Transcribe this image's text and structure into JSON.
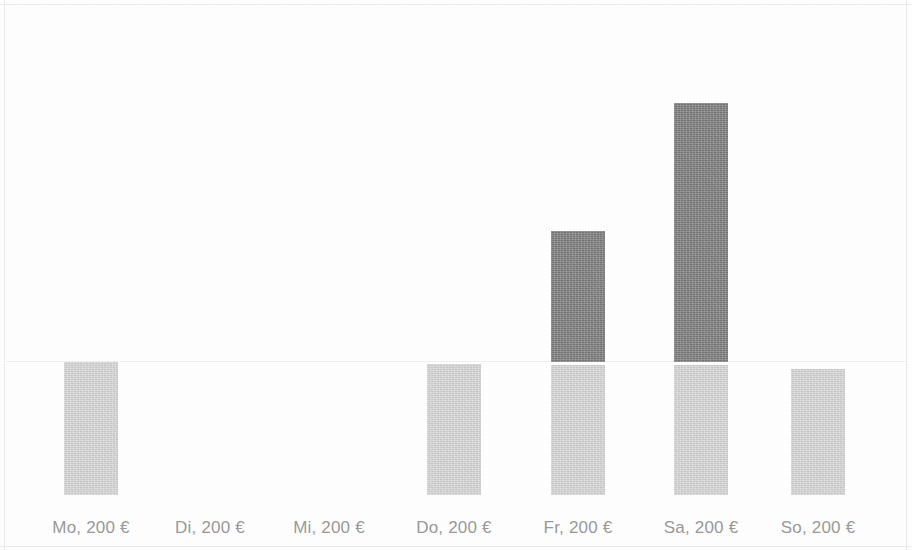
{
  "chart_data": {
    "type": "bar",
    "stacked": true,
    "title": "",
    "subtitle": "",
    "xlabel": "",
    "ylabel": "",
    "grid": false,
    "legend": "none",
    "axis_visible": false,
    "ylim": [
      0,
      600
    ],
    "categories": [
      "Mo, 200 €",
      "Di, 200 €",
      "Mi, 200 €",
      "Do, 200 €",
      "Fr, 200 €",
      "Sa, 200 €",
      "So, 200 €"
    ],
    "series": [
      {
        "name": "base",
        "color": "#d6d6d6",
        "values": [
          200,
          0,
          0,
          200,
          200,
          200,
          193
        ]
      },
      {
        "name": "extra",
        "color": "#7c7c7c",
        "values": [
          0,
          0,
          0,
          0,
          200,
          396,
          0
        ]
      }
    ],
    "annotations": []
  },
  "colors": {
    "background": "#ffffff",
    "series_light": "#d6d6d6",
    "series_dark": "#7c7c7c",
    "label_text": "#9a9a9a",
    "frame": "#ebebeb"
  },
  "geometry": {
    "baseline_y": 495,
    "bar_width": 54,
    "slot_pitch": 119,
    "first_slot_center_x": 90,
    "segment_gap": 3,
    "bars": [
      {
        "category_index": 0,
        "lower_px": 133,
        "upper_px": 0,
        "center_x": 91
      },
      {
        "category_index": 1,
        "lower_px": 0,
        "upper_px": 0,
        "center_x": 210
      },
      {
        "category_index": 2,
        "lower_px": 0,
        "upper_px": 0,
        "center_x": 329
      },
      {
        "category_index": 3,
        "lower_px": 131,
        "upper_px": 0,
        "center_x": 454
      },
      {
        "category_index": 4,
        "lower_px": 130,
        "upper_px": 131,
        "center_x": 578
      },
      {
        "category_index": 5,
        "lower_px": 130,
        "upper_px": 259,
        "center_x": 701
      },
      {
        "category_index": 6,
        "lower_px": 126,
        "upper_px": 0,
        "center_x": 818
      }
    ]
  }
}
